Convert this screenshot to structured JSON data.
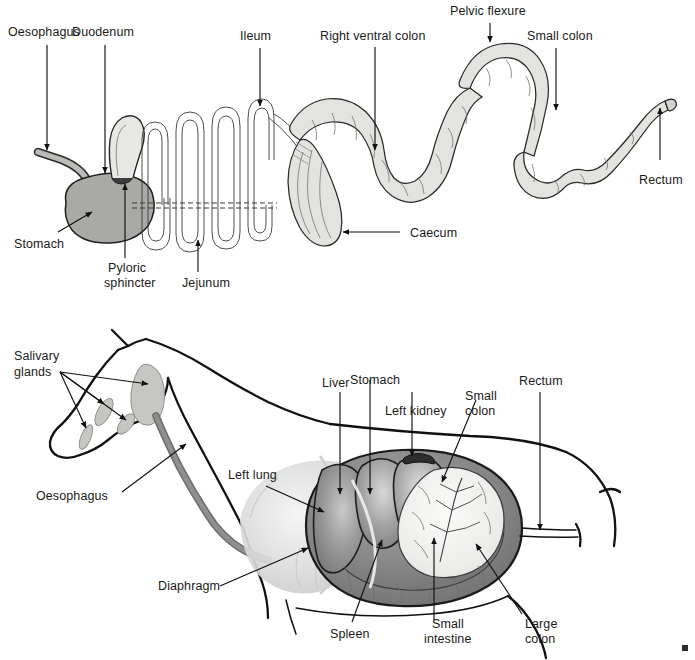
{
  "figure": {
    "panels": [
      {
        "id": "upper",
        "name": "Schematic of the horse digestive tract",
        "labels": [
          {
            "key": "oesophagus",
            "text": "Oesophagus"
          },
          {
            "key": "duodenum",
            "text": "Duodenum"
          },
          {
            "key": "ileum",
            "text": "Ileum"
          },
          {
            "key": "right_ventral_colon",
            "text": "Right ventral colon"
          },
          {
            "key": "pelvic_flexure",
            "text": "Pelvic flexure"
          },
          {
            "key": "small_colon",
            "text": "Small colon"
          },
          {
            "key": "rectum",
            "text": "Rectum"
          },
          {
            "key": "stomach",
            "text": "Stomach"
          },
          {
            "key": "pyloric_sphincter_line1",
            "text": "Pyloric"
          },
          {
            "key": "pyloric_sphincter_line2",
            "text": "sphincter"
          },
          {
            "key": "jejunum",
            "text": "Jejunum"
          },
          {
            "key": "caecum",
            "text": "Caecum"
          }
        ]
      },
      {
        "id": "lower",
        "name": "In-situ position of organs in the horse",
        "labels": [
          {
            "key": "salivary_glands_line1",
            "text": "Salivary"
          },
          {
            "key": "salivary_glands_line2",
            "text": "glands"
          },
          {
            "key": "oesophagus",
            "text": "Oesophagus"
          },
          {
            "key": "left_lung",
            "text": "Left lung"
          },
          {
            "key": "diaphragm",
            "text": "Diaphragm"
          },
          {
            "key": "liver",
            "text": "Liver"
          },
          {
            "key": "stomach",
            "text": "Stomach"
          },
          {
            "key": "left_kidney",
            "text": "Left kidney"
          },
          {
            "key": "small_colon_line1",
            "text": "Small"
          },
          {
            "key": "small_colon_line2",
            "text": "colon"
          },
          {
            "key": "rectum",
            "text": "Rectum"
          },
          {
            "key": "spleen",
            "text": "Spleen"
          },
          {
            "key": "small_intestine_line1",
            "text": "Small"
          },
          {
            "key": "small_intestine_line2",
            "text": "intestine"
          },
          {
            "key": "large_colon_line1",
            "text": "Large"
          },
          {
            "key": "large_colon_line2",
            "text": "colon"
          }
        ]
      }
    ]
  },
  "colors": {
    "label_text": "#1a1a1a",
    "leader_line": "#111111",
    "gut_fill": "#e3e3e0",
    "gut_stroke": "#2a2a2a",
    "oesophagus_fill": "#b9b9b6",
    "stomach_fill": "#a9a9a6",
    "pylorus_dark": "#4a4a4a",
    "horse_outline": "#111111",
    "lung_light": "#dedede",
    "liver_mid": "#8e8e8e",
    "colon_dark": "#767676",
    "intestine_light": "#f0f0ee",
    "background": "#ffffff"
  }
}
